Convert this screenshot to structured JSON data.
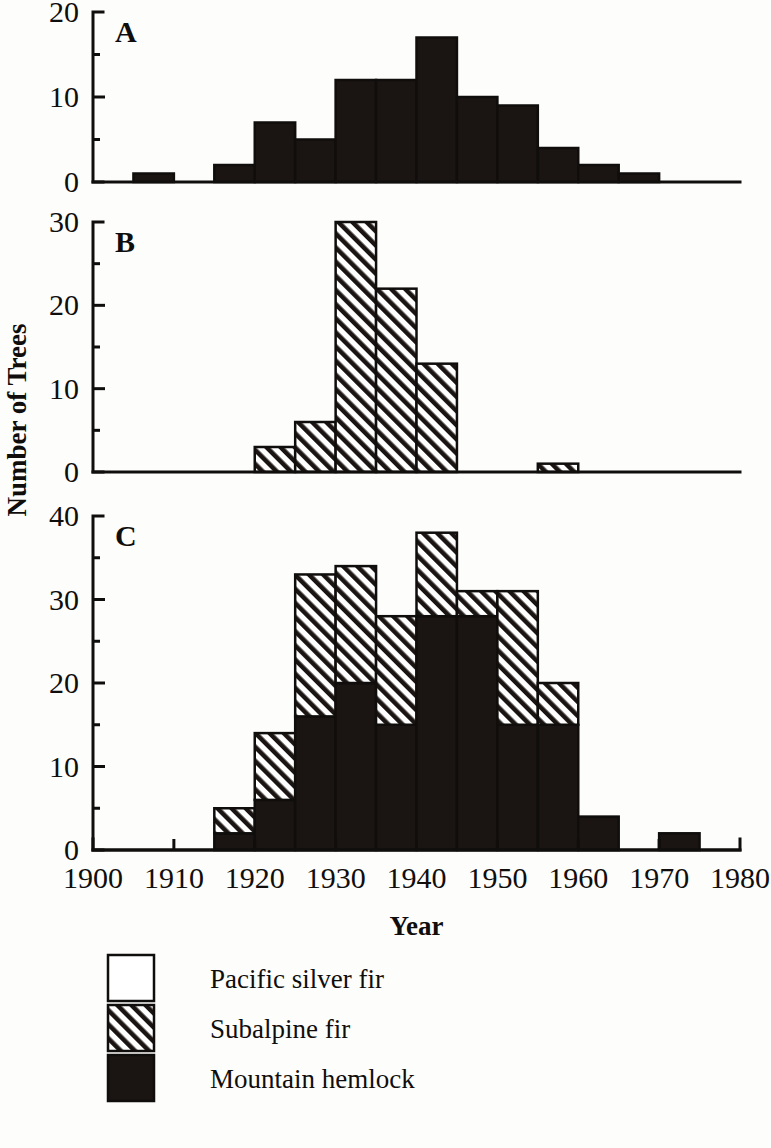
{
  "figure": {
    "y_axis_title": "Number of Trees",
    "x_axis_title": "Year"
  },
  "legend": {
    "items": [
      {
        "key": "pacific_silver_fir",
        "label": "Pacific silver fir",
        "swatch": "open",
        "color": "#ffffff"
      },
      {
        "key": "subalpine_fir",
        "label": "Subalpine fir",
        "swatch": "hatched",
        "color": "#ffffff"
      },
      {
        "key": "mountain_hemlock",
        "label": "Mountain hemlock",
        "swatch": "solid",
        "color": "#1a1512"
      }
    ]
  },
  "chart_data": [
    {
      "id": "panel-a",
      "type": "bar",
      "title": "A",
      "panel_letter": "A",
      "xlabel": "Year",
      "ylabel": "Number of Trees",
      "xlim": [
        1900,
        1980
      ],
      "ylim": [
        0,
        20
      ],
      "yticks": [
        0,
        10,
        20
      ],
      "ytick_labels": [
        "0",
        "10",
        "20"
      ],
      "xticks": [
        1900,
        1910,
        1920,
        1930,
        1940,
        1950,
        1960,
        1970,
        1980
      ],
      "xtick_labels": [
        "1900",
        "1910",
        "1920",
        "1930",
        "1940",
        "1950",
        "1960",
        "1970",
        "1980"
      ],
      "bin_width": 5,
      "grid": false,
      "series": [
        {
          "name": "Mountain hemlock",
          "style": "solid",
          "bins": [
            1905,
            1910,
            1915,
            1920,
            1925,
            1930,
            1935,
            1940,
            1945,
            1950,
            1955,
            1960,
            1965
          ],
          "values": [
            1,
            0,
            2,
            7,
            5,
            12,
            12,
            17,
            10,
            9,
            4,
            2,
            1
          ]
        }
      ]
    },
    {
      "id": "panel-b",
      "type": "bar",
      "title": "B",
      "panel_letter": "B",
      "xlabel": "Year",
      "ylabel": "Number of Trees",
      "xlim": [
        1900,
        1980
      ],
      "ylim": [
        0,
        30
      ],
      "yticks": [
        0,
        10,
        20,
        30
      ],
      "ytick_labels": [
        "0",
        "10",
        "20",
        "30"
      ],
      "xticks": [
        1900,
        1910,
        1920,
        1930,
        1940,
        1950,
        1960,
        1970,
        1980
      ],
      "xtick_labels": [
        "1900",
        "1910",
        "1920",
        "1930",
        "1940",
        "1950",
        "1960",
        "1970",
        "1980"
      ],
      "bin_width": 5,
      "grid": false,
      "series": [
        {
          "name": "Subalpine fir",
          "style": "hatched",
          "bins": [
            1920,
            1925,
            1930,
            1935,
            1940,
            1955
          ],
          "values": [
            3,
            6,
            30,
            22,
            13,
            1
          ]
        }
      ]
    },
    {
      "id": "panel-c",
      "type": "bar",
      "title": "C",
      "panel_letter": "C",
      "xlabel": "Year",
      "ylabel": "Number of Trees",
      "xlim": [
        1900,
        1980
      ],
      "ylim": [
        0,
        40
      ],
      "yticks": [
        0,
        10,
        20,
        30,
        40
      ],
      "ytick_labels": [
        "0",
        "10",
        "20",
        "30",
        "40"
      ],
      "xticks": [
        1900,
        1910,
        1920,
        1930,
        1940,
        1950,
        1960,
        1970,
        1980
      ],
      "xtick_labels": [
        "1900",
        "1910",
        "1920",
        "1930",
        "1940",
        "1950",
        "1960",
        "1970",
        "1980"
      ],
      "bin_width": 5,
      "grid": false,
      "stacked": true,
      "bins": [
        1915,
        1920,
        1925,
        1930,
        1935,
        1940,
        1945,
        1950,
        1955,
        1960,
        1965,
        1970
      ],
      "series": [
        {
          "name": "Mountain hemlock",
          "style": "solid",
          "values": [
            2,
            6,
            16,
            20,
            15,
            28,
            28,
            15,
            15,
            4,
            0,
            2
          ]
        },
        {
          "name": "Subalpine fir",
          "style": "hatched",
          "values": [
            3,
            8,
            17,
            14,
            13,
            10,
            3,
            16,
            5,
            0,
            0,
            0
          ]
        },
        {
          "name": "Pacific silver fir",
          "style": "open",
          "values": [
            0,
            0,
            0,
            0,
            0,
            0,
            0,
            0,
            0,
            0,
            0,
            0
          ]
        }
      ],
      "totals": [
        5,
        14,
        33,
        34,
        28,
        38,
        31,
        31,
        20,
        4,
        0,
        2
      ]
    }
  ]
}
